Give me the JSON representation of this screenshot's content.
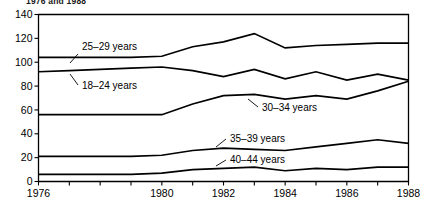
{
  "title": "1976 and 1988",
  "chart_data": {
    "type": "line",
    "title": "1976 and 1988",
    "xlabel": "",
    "ylabel": "",
    "xlim": [
      1976,
      1988
    ],
    "ylim": [
      0,
      140
    ],
    "yticks": [
      0,
      20,
      40,
      60,
      80,
      100,
      120,
      140
    ],
    "xticks": [
      1976,
      1977,
      1978,
      1979,
      1980,
      1981,
      1982,
      1983,
      1984,
      1985,
      1986,
      1987,
      1988
    ],
    "xticklabels": [
      "1976",
      "",
      "",
      "",
      "1980",
      "",
      "1982",
      "",
      "1984",
      "",
      "1986",
      "",
      "1988"
    ],
    "grid": false,
    "legend": "inline-labels",
    "x": [
      1976,
      1977,
      1978,
      1979,
      1980,
      1981,
      1982,
      1983,
      1984,
      1985,
      1986,
      1987,
      1988
    ],
    "series": [
      {
        "name": "25-29 years",
        "label": "25–29 years",
        "values": [
          104,
          104,
          104,
          104,
          105,
          113,
          117,
          124,
          112,
          114,
          115,
          116,
          116
        ]
      },
      {
        "name": "18-24 years",
        "label": "18–24 years",
        "values": [
          92,
          93,
          94,
          95,
          96,
          93,
          88,
          94,
          86,
          92,
          85,
          90,
          85
        ]
      },
      {
        "name": "30-34 years",
        "label": "30–34 years",
        "values": [
          56,
          56,
          56,
          56,
          56,
          65,
          72,
          73,
          69,
          72,
          69,
          76,
          84
        ]
      },
      {
        "name": "35-39 years",
        "label": "35–39 years",
        "values": [
          21,
          21,
          21,
          21,
          22,
          26,
          28,
          27,
          26,
          29,
          32,
          35,
          32
        ]
      },
      {
        "name": "40-44 years",
        "label": "40–44 years",
        "values": [
          6,
          6,
          6,
          6,
          7,
          10,
          11,
          12,
          9,
          11,
          10,
          12,
          12
        ]
      }
    ],
    "annotations": [
      {
        "text": "25–29 years",
        "x": 82,
        "y": 50,
        "leader": [
          [
            78,
            54
          ],
          [
            70,
            63
          ]
        ]
      },
      {
        "text": "18–24 years",
        "x": 82,
        "y": 89,
        "leader": [
          [
            78,
            85
          ],
          [
            70,
            74
          ]
        ]
      },
      {
        "text": "30–34 years",
        "x": 262,
        "y": 111,
        "leader": [
          [
            258,
            107
          ],
          [
            248,
            99
          ]
        ]
      },
      {
        "text": "35–39 years",
        "x": 230,
        "y": 142,
        "leader": [
          [
            226,
            139
          ],
          [
            216,
            147
          ]
        ]
      },
      {
        "text": "40–44 years",
        "x": 230,
        "y": 163,
        "leader": [
          [
            226,
            160
          ],
          [
            216,
            166
          ]
        ]
      }
    ]
  }
}
